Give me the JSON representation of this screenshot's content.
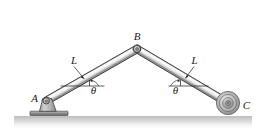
{
  "figure": {
    "background_color": "#ffffff",
    "labels": {
      "joint_a": "A",
      "joint_b": "B",
      "joint_c": "C",
      "length_left": "L",
      "length_right": "L",
      "angle_left": "θ",
      "angle_right": "θ"
    },
    "colors": {
      "bar_outline": "#3a3a3a",
      "bar_fill_light": "#f2f2f2",
      "bar_fill_mid": "#c9c9c9",
      "bar_fill_dark": "#8f8f8f",
      "support_fill": "#a8a8a8",
      "support_outline": "#4a4a4a",
      "wheel_outer": "#9a9a9a",
      "wheel_mid": "#c2c2c2",
      "wheel_hub": "#8a8a8a",
      "ground_line": "#4f4f4f",
      "ground_shadow": "#cfcfcf",
      "leader_line": "#2b2b2b",
      "text": "#1a1a1a"
    },
    "geometry": {
      "point_a": [
        46,
        101
      ],
      "point_b": [
        137,
        49
      ],
      "point_c": [
        228,
        103
      ],
      "ground_y": 115,
      "wheel_radius": 11
    }
  }
}
